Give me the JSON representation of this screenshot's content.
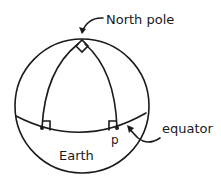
{
  "diagram": {
    "type": "spherical-geometry",
    "labels": {
      "north_pole": "North pole",
      "equator": "equator",
      "earth": "Earth",
      "point": "p"
    },
    "colors": {
      "ink": "#1a1a1a",
      "background": "#ffffff"
    }
  }
}
